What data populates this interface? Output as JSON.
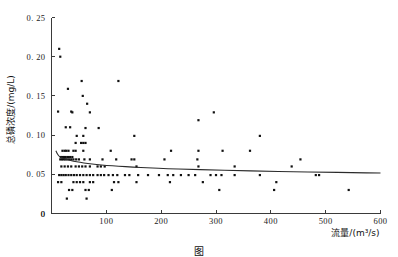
{
  "figure": {
    "caption": "图",
    "background_color": "#ffffff",
    "point_color": "#111111",
    "line_color": "#2b2b2b",
    "axis_color": "#3a3a3a"
  },
  "chart_data": {
    "type": "scatter",
    "title": "",
    "xlabel": "流量/(m³/s)",
    "ylabel": "总磷浓度/(mg/L)",
    "xlim": [
      0,
      600
    ],
    "ylim": [
      0,
      0.25
    ],
    "xticks": [
      0,
      100,
      200,
      300,
      400,
      500,
      600
    ],
    "xtick_labels": [
      "0",
      "100",
      "200",
      "300",
      "400",
      "500",
      "600"
    ],
    "yticks": [
      0,
      0.05,
      0.1,
      0.15,
      0.2,
      0.25
    ],
    "ytick_labels": [
      "0",
      "0. 05",
      "0. 10",
      "0. 15",
      "0. 20",
      "0. 25"
    ],
    "grid": false,
    "legend": null,
    "marker": "square",
    "marker_size": 2.2,
    "series": [
      {
        "name": "总磷浓度观测值",
        "points": [
          [
            14,
            0.21
          ],
          [
            16,
            0.2
          ],
          [
            12,
            0.13
          ],
          [
            36,
            0.13
          ],
          [
            26,
            0.11
          ],
          [
            34,
            0.11
          ],
          [
            30,
            0.159
          ],
          [
            55,
            0.169
          ],
          [
            122,
            0.169
          ],
          [
            57,
            0.15
          ],
          [
            65,
            0.14
          ],
          [
            70,
            0.129
          ],
          [
            38,
            0.129
          ],
          [
            62,
            0.109
          ],
          [
            86,
            0.109
          ],
          [
            46,
            0.099
          ],
          [
            58,
            0.099
          ],
          [
            151,
            0.099
          ],
          [
            380,
            0.099
          ],
          [
            296,
            0.129
          ],
          [
            268,
            0.119
          ],
          [
            44,
            0.09
          ],
          [
            54,
            0.09
          ],
          [
            58,
            0.09
          ],
          [
            62,
            0.09
          ],
          [
            20,
            0.08
          ],
          [
            24,
            0.08
          ],
          [
            27,
            0.08
          ],
          [
            31,
            0.08
          ],
          [
            40,
            0.08
          ],
          [
            44,
            0.08
          ],
          [
            58,
            0.08
          ],
          [
            108,
            0.08
          ],
          [
            218,
            0.08
          ],
          [
            268,
            0.08
          ],
          [
            312,
            0.08
          ],
          [
            362,
            0.08
          ],
          [
            17,
            0.072
          ],
          [
            20,
            0.072
          ],
          [
            23,
            0.072
          ],
          [
            26,
            0.072
          ],
          [
            30,
            0.072
          ],
          [
            34,
            0.072
          ],
          [
            38,
            0.072
          ],
          [
            16,
            0.069
          ],
          [
            19,
            0.069
          ],
          [
            22,
            0.069
          ],
          [
            25,
            0.069
          ],
          [
            28,
            0.069
          ],
          [
            32,
            0.069
          ],
          [
            36,
            0.069
          ],
          [
            40,
            0.069
          ],
          [
            45,
            0.069
          ],
          [
            50,
            0.069
          ],
          [
            60,
            0.069
          ],
          [
            70,
            0.069
          ],
          [
            93,
            0.069
          ],
          [
            118,
            0.069
          ],
          [
            146,
            0.069
          ],
          [
            206,
            0.069
          ],
          [
            266,
            0.069
          ],
          [
            454,
            0.069
          ],
          [
            18,
            0.06
          ],
          [
            24,
            0.06
          ],
          [
            30,
            0.06
          ],
          [
            36,
            0.06
          ],
          [
            44,
            0.06
          ],
          [
            50,
            0.06
          ],
          [
            56,
            0.06
          ],
          [
            62,
            0.06
          ],
          [
            70,
            0.06
          ],
          [
            84,
            0.06
          ],
          [
            90,
            0.06
          ],
          [
            155,
            0.06
          ],
          [
            268,
            0.06
          ],
          [
            334,
            0.06
          ],
          [
            438,
            0.06
          ],
          [
            151,
            0.069
          ],
          [
            97,
            0.06
          ],
          [
            14,
            0.049
          ],
          [
            18,
            0.049
          ],
          [
            22,
            0.049
          ],
          [
            26,
            0.049
          ],
          [
            31,
            0.049
          ],
          [
            36,
            0.049
          ],
          [
            41,
            0.049
          ],
          [
            46,
            0.049
          ],
          [
            52,
            0.049
          ],
          [
            58,
            0.049
          ],
          [
            64,
            0.049
          ],
          [
            70,
            0.049
          ],
          [
            76,
            0.049
          ],
          [
            84,
            0.049
          ],
          [
            90,
            0.049
          ],
          [
            96,
            0.049
          ],
          [
            104,
            0.049
          ],
          [
            112,
            0.049
          ],
          [
            120,
            0.049
          ],
          [
            134,
            0.049
          ],
          [
            142,
            0.049
          ],
          [
            158,
            0.049
          ],
          [
            176,
            0.049
          ],
          [
            196,
            0.049
          ],
          [
            212,
            0.049
          ],
          [
            222,
            0.049
          ],
          [
            236,
            0.049
          ],
          [
            250,
            0.049
          ],
          [
            262,
            0.049
          ],
          [
            290,
            0.049
          ],
          [
            300,
            0.049
          ],
          [
            310,
            0.049
          ],
          [
            334,
            0.049
          ],
          [
            380,
            0.049
          ],
          [
            482,
            0.049
          ],
          [
            488,
            0.049
          ],
          [
            12,
            0.04
          ],
          [
            18,
            0.04
          ],
          [
            40,
            0.04
          ],
          [
            46,
            0.04
          ],
          [
            52,
            0.04
          ],
          [
            58,
            0.04
          ],
          [
            70,
            0.04
          ],
          [
            76,
            0.04
          ],
          [
            114,
            0.04
          ],
          [
            122,
            0.04
          ],
          [
            155,
            0.04
          ],
          [
            216,
            0.04
          ],
          [
            276,
            0.04
          ],
          [
            410,
            0.04
          ],
          [
            32,
            0.03
          ],
          [
            38,
            0.03
          ],
          [
            62,
            0.03
          ],
          [
            68,
            0.03
          ],
          [
            110,
            0.03
          ],
          [
            306,
            0.03
          ],
          [
            406,
            0.03
          ],
          [
            542,
            0.03
          ],
          [
            28,
            0.019
          ],
          [
            64,
            0.019
          ]
        ]
      }
    ],
    "trend": {
      "name": "拟合趋势线",
      "style": "solid",
      "points": [
        [
          8,
          0.08
        ],
        [
          10,
          0.077
        ],
        [
          13,
          0.0735
        ],
        [
          17,
          0.0715
        ],
        [
          22,
          0.07
        ],
        [
          30,
          0.0685
        ],
        [
          40,
          0.0668
        ],
        [
          52,
          0.0652
        ],
        [
          66,
          0.0638
        ],
        [
          82,
          0.0625
        ],
        [
          100,
          0.0614
        ],
        [
          122,
          0.0603
        ],
        [
          148,
          0.0592
        ],
        [
          178,
          0.0582
        ],
        [
          212,
          0.0572
        ],
        [
          250,
          0.0563
        ],
        [
          292,
          0.0555
        ],
        [
          338,
          0.0547
        ],
        [
          388,
          0.054
        ],
        [
          440,
          0.0533
        ],
        [
          495,
          0.0527
        ],
        [
          548,
          0.0521
        ],
        [
          600,
          0.0516
        ]
      ]
    }
  },
  "axes": {
    "x_axis_name": "x-axis",
    "y_axis_name": "y-axis"
  }
}
